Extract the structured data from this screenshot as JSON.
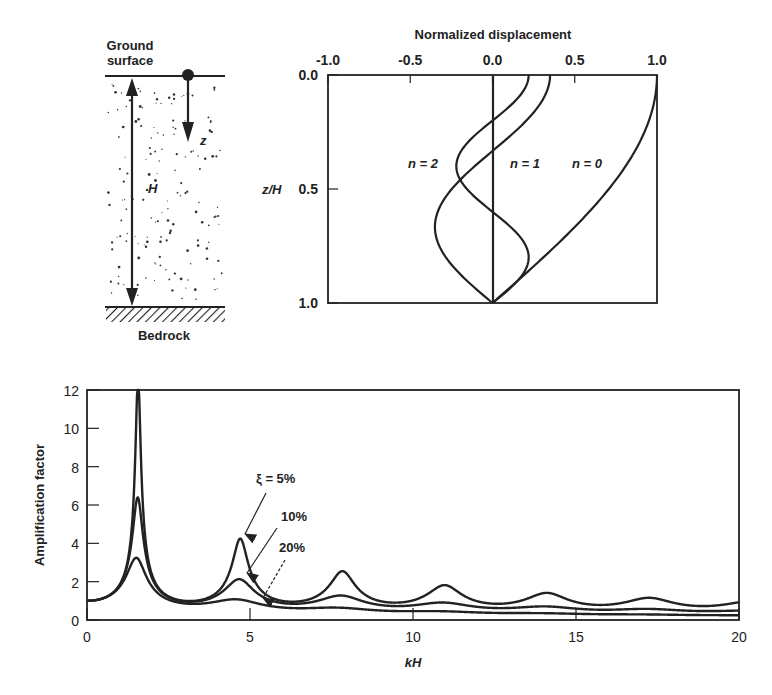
{
  "soil_column": {
    "top_label_line1": "Ground",
    "top_label_line2": "surface",
    "bottom_label": "Bedrock",
    "height_label": "H",
    "depth_label": "z"
  },
  "chart_data": [
    {
      "type": "line",
      "title": "Normalized displacement",
      "xlabel": "Normalized displacement",
      "ylabel": "z/H",
      "xlim": [
        -1.0,
        1.0
      ],
      "ylim": [
        0.0,
        1.0
      ],
      "y_inverted": true,
      "x_axis_position": "top",
      "xticks": [
        "-1.0",
        "-0.5",
        "0.0",
        "0.5",
        "1.0"
      ],
      "yticks": [
        "0.0",
        "0.5",
        "1.0"
      ],
      "grid": false,
      "series": [
        {
          "name": "n = 0",
          "label": "n = 0",
          "surface_value": 1.0,
          "formula": "cos(pi/2 * z/H)"
        },
        {
          "name": "n = 1",
          "label": "n = 1",
          "surface_value": 0.35,
          "formula": "0.35 * cos(3pi/2 * z/H)"
        },
        {
          "name": "n = 2",
          "label": "n = 2",
          "surface_value": 0.22,
          "formula": "0.22 * cos(5pi/2 * z/H)"
        }
      ],
      "sample_points": {
        "z_over_H": [
          0.0,
          0.25,
          0.5,
          0.75,
          1.0
        ],
        "n0": [
          1.0,
          0.92,
          0.71,
          0.38,
          0.0
        ],
        "n1": [
          0.35,
          0.13,
          -0.25,
          -0.32,
          0.0
        ],
        "n2": [
          0.22,
          -0.15,
          -0.16,
          0.2,
          0.0
        ]
      }
    },
    {
      "type": "line",
      "title": "",
      "xlabel": "kH",
      "ylabel": "Amplification factor",
      "xlim": [
        0,
        20
      ],
      "ylim": [
        0,
        12
      ],
      "xticks": [
        "0",
        "5",
        "10",
        "15",
        "20"
      ],
      "yticks": [
        "0",
        "2",
        "4",
        "6",
        "8",
        "10",
        "12"
      ],
      "grid": false,
      "series": [
        {
          "name": "ξ = 5%",
          "damping": 0.05,
          "peaks": [
            [
              1.57,
              12.0
            ],
            [
              4.71,
              4.2
            ],
            [
              7.85,
              2.5
            ],
            [
              11.0,
              1.9
            ],
            [
              14.1,
              1.5
            ],
            [
              17.3,
              1.3
            ]
          ]
        },
        {
          "name": "10%",
          "damping": 0.1,
          "peaks": [
            [
              1.57,
              6.2
            ],
            [
              4.71,
              2.1
            ],
            [
              7.85,
              1.3
            ],
            [
              11.0,
              1.0
            ]
          ]
        },
        {
          "name": "20%",
          "damping": 0.2,
          "peaks": [
            [
              1.57,
              3.2
            ],
            [
              4.71,
              1.1
            ]
          ]
        }
      ],
      "annotations": [
        "ξ = 5%",
        "10%",
        "20%"
      ]
    }
  ]
}
